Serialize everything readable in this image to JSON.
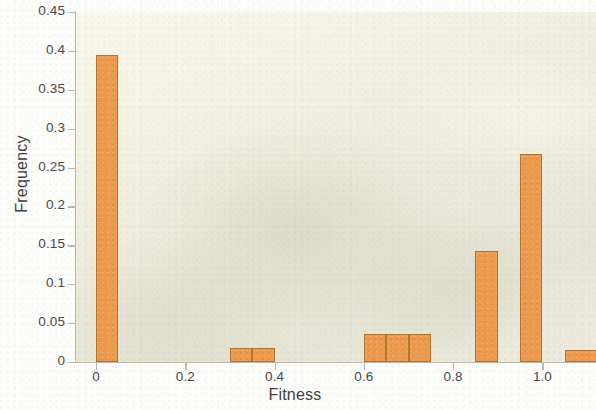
{
  "chart_data": {
    "type": "bar",
    "title": "",
    "subtitle": "",
    "xlabel": "Fitness",
    "ylabel": "Frequency",
    "xlim": [
      -0.045,
      1.12
    ],
    "ylim": [
      0,
      0.45
    ],
    "grid": false,
    "legend": null,
    "legend_position": "none",
    "bin_width": 0.05,
    "x_ticks": [
      0,
      0.2,
      0.4,
      0.6,
      0.8,
      1.0
    ],
    "x_tick_labels": [
      "0",
      "0.2",
      "0.4",
      "0.6",
      "0.8",
      "1.0"
    ],
    "y_ticks": [
      0,
      0.05,
      0.1,
      0.15,
      0.2,
      0.25,
      0.3,
      0.35,
      0.4,
      0.45
    ],
    "y_tick_labels": [
      "0",
      "0.05",
      "0.1",
      "0.15",
      "0.2",
      "0.25",
      "0.3",
      "0.35",
      "0.4",
      "0.45"
    ],
    "bar_color": "#ee9a4d",
    "bar_edge_color": "#b4742f",
    "plot_background": "#efeddf",
    "axis_color": "#b9b9b0",
    "text_color": "#4a4a4a",
    "bins": [
      {
        "x0": 0.0,
        "x1": 0.05,
        "value": 0.395
      },
      {
        "x0": 0.3,
        "x1": 0.35,
        "value": 0.018
      },
      {
        "x0": 0.35,
        "x1": 0.4,
        "value": 0.018
      },
      {
        "x0": 0.6,
        "x1": 0.65,
        "value": 0.036
      },
      {
        "x0": 0.65,
        "x1": 0.7,
        "value": 0.036
      },
      {
        "x0": 0.7,
        "x1": 0.75,
        "value": 0.036
      },
      {
        "x0": 0.85,
        "x1": 0.9,
        "value": 0.143
      },
      {
        "x0": 0.95,
        "x1": 1.0,
        "value": 0.268
      },
      {
        "x0": 1.05,
        "x1": 1.12,
        "value": 0.015
      }
    ],
    "categories": [
      "0.00-0.05",
      "0.30-0.35",
      "0.35-0.40",
      "0.60-0.65",
      "0.65-0.70",
      "0.70-0.75",
      "0.85-0.90",
      "0.95-1.00",
      "1.05-1.10"
    ],
    "values": [
      0.395,
      0.018,
      0.018,
      0.036,
      0.036,
      0.036,
      0.143,
      0.268,
      0.015
    ]
  }
}
